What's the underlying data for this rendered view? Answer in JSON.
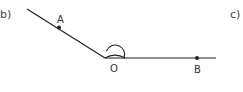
{
  "parts": {
    "left": "b)",
    "right": "c)"
  },
  "points": {
    "A": {
      "label": "A"
    },
    "O": {
      "label": "O"
    },
    "B": {
      "label": "B"
    }
  },
  "colors": {
    "stroke": "#222222",
    "text": "#333333"
  }
}
